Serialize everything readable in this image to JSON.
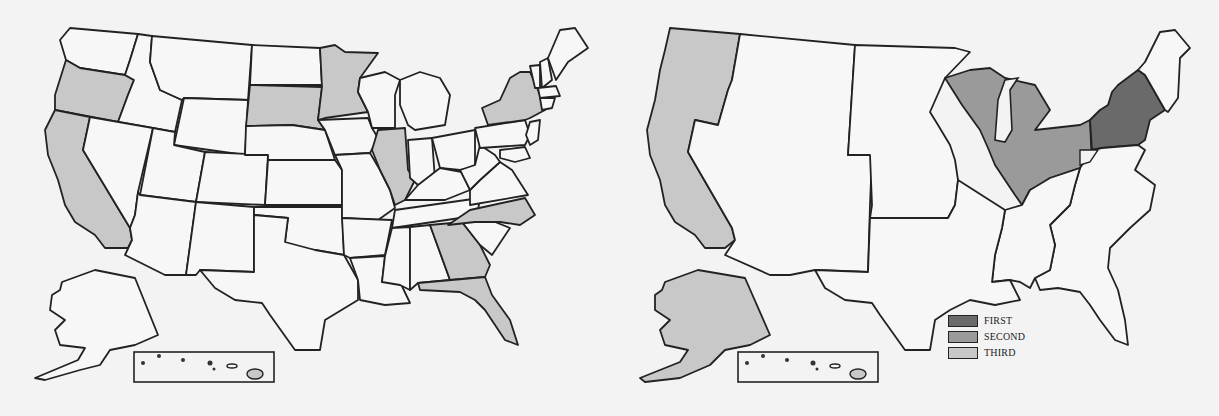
{
  "colors": {
    "background": "#f3f3f3",
    "unshaded": "#f7f7f7",
    "outline": "#222222",
    "first": "#6a6a6a",
    "second": "#9a9a9a",
    "third": "#c8c8c8"
  },
  "left_map": {
    "title": "",
    "shaded_states": [
      "Oregon",
      "California",
      "South Dakota",
      "Minnesota",
      "Illinois",
      "New York",
      "North Carolina",
      "Georgia",
      "Florida",
      "Hawaii"
    ],
    "shade_level": "third",
    "inset": "Hawaii"
  },
  "right_map": {
    "title": "",
    "regions": [
      {
        "name": "Mid-Atlantic (NY, PA, NJ)",
        "rank": "FIRST"
      },
      {
        "name": "Great Lakes (WI, IL, MI, IN, OH)",
        "rank": "SECOND"
      },
      {
        "name": "Pacific (WA, OR, CA, AK, HI)",
        "rank": "THIRD"
      }
    ],
    "inset": "Hawaii"
  },
  "legend": {
    "items": [
      {
        "label": "FIRST",
        "color": "#6a6a6a"
      },
      {
        "label": "SECOND",
        "color": "#9a9a9a"
      },
      {
        "label": "THIRD",
        "color": "#c8c8c8"
      }
    ]
  }
}
